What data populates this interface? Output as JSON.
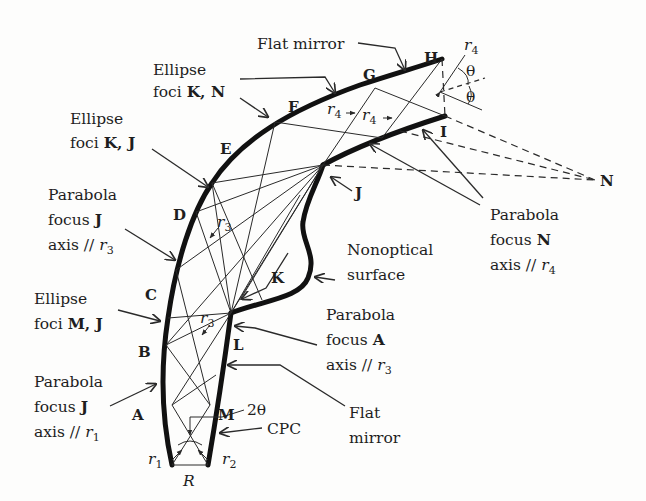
{
  "figure": {
    "points": {
      "A": "A",
      "B": "B",
      "C": "C",
      "D": "D",
      "E": "E",
      "F": "F",
      "G": "G",
      "H": "H",
      "I": "I",
      "J": "J",
      "K": "K",
      "L": "L",
      "M": "M",
      "N": "N",
      "R": "R"
    },
    "rays": {
      "r": "r",
      "r1_sub": "1",
      "r2_sub": "2",
      "r3_sub": "3",
      "r4_sub": "4"
    },
    "angles": {
      "theta": "θ",
      "two_theta": "2θ"
    },
    "labels": {
      "flat_mirror_top": "Flat mirror",
      "ellipse_kn": {
        "line1": "Ellipse",
        "line2_prefix": "foci ",
        "line2_bold": "K, N"
      },
      "ellipse_kj": {
        "line1": "Ellipse",
        "line2_prefix": "foci ",
        "line2_bold": "K, J"
      },
      "parabola_j_r3": {
        "line1": "Parabola",
        "line2_prefix": "focus ",
        "line2_bold": "J",
        "line3_prefix": "axis // "
      },
      "ellipse_mj": {
        "line1": "Ellipse",
        "line2_prefix": "foci ",
        "line2_bold": "M, J"
      },
      "parabola_j_r1": {
        "line1": "Parabola",
        "line2_prefix": "focus ",
        "line2_bold": "J",
        "line3_prefix": "axis // "
      },
      "nonoptical": {
        "line1": "Nonoptical",
        "line2": "surface"
      },
      "parabola_a_r3": {
        "line1": "Parabola",
        "line2_prefix": "focus ",
        "line2_bold": "A",
        "line3_prefix": "axis // "
      },
      "flat_mirror_bottom": {
        "line1": "Flat",
        "line2": "mirror"
      },
      "cpc": "CPC",
      "parabola_n_r4": {
        "line1": "Parabola",
        "line2_prefix": "focus ",
        "line2_bold": "N",
        "line3_prefix": "axis // "
      }
    },
    "colors": {
      "ink": "#1e1e1e",
      "background": "#fdfdfc"
    }
  }
}
